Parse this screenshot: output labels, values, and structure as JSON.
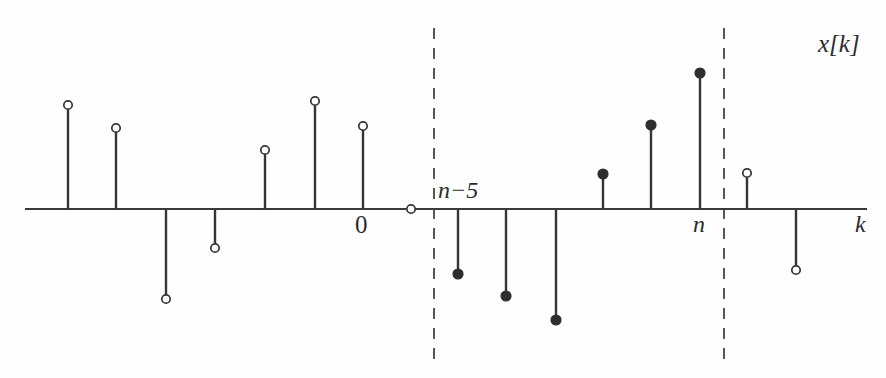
{
  "figure": {
    "title": "x[k]",
    "axis_label_x": "k",
    "origin_label": "0",
    "window_start_label": "n−5",
    "window_end_label": "n",
    "colors": {
      "axis": "#3a3a3a",
      "stem": "#353535",
      "marker_filled": "#2e2e2e",
      "marker_open_fill": "#ffffff",
      "window_dash": "#565656",
      "background": "#fefefe"
    }
  },
  "chart_data": {
    "type": "scatter",
    "title": "x[k]",
    "xlabel": "k",
    "ylabel": "",
    "grid": false,
    "legend": null,
    "axis_y_px": 209,
    "axis_x_range_px": [
      25,
      867
    ],
    "window_boundaries_px": [
      434,
      724
    ],
    "window_dash_y_range_px": [
      28,
      360
    ],
    "marker_radius_px": 4.2,
    "marker_radius_filled_px": 5.0,
    "x": [
      68,
      116,
      166,
      215,
      265,
      315,
      363,
      411,
      458,
      506,
      556,
      603,
      651,
      700,
      747,
      796
    ],
    "values": [
      104,
      81,
      -90,
      -39,
      59,
      108,
      83,
      0,
      -65,
      -87,
      -111,
      35,
      84,
      136,
      36,
      -61
    ],
    "marker_styles": [
      "open",
      "open",
      "open",
      "open",
      "open",
      "open",
      "open",
      "open",
      "filled",
      "filled",
      "filled",
      "filled",
      "filled",
      "filled",
      "open",
      "open"
    ],
    "points": [
      {
        "x_px": 68,
        "value": 104,
        "marker": "open"
      },
      {
        "x_px": 116,
        "value": 81,
        "marker": "open"
      },
      {
        "x_px": 166,
        "value": -90,
        "marker": "open"
      },
      {
        "x_px": 215,
        "value": -39,
        "marker": "open"
      },
      {
        "x_px": 265,
        "value": 59,
        "marker": "open"
      },
      {
        "x_px": 315,
        "value": 108,
        "marker": "open"
      },
      {
        "x_px": 363,
        "value": 83,
        "marker": "open"
      },
      {
        "x_px": 411,
        "value": 0,
        "marker": "open"
      },
      {
        "x_px": 458,
        "value": -65,
        "marker": "filled"
      },
      {
        "x_px": 506,
        "value": -87,
        "marker": "filled"
      },
      {
        "x_px": 556,
        "value": -111,
        "marker": "filled"
      },
      {
        "x_px": 603,
        "value": 35,
        "marker": "filled"
      },
      {
        "x_px": 651,
        "value": 84,
        "marker": "filled"
      },
      {
        "x_px": 700,
        "value": 136,
        "marker": "filled"
      },
      {
        "x_px": 747,
        "value": 36,
        "marker": "open"
      },
      {
        "x_px": 796,
        "value": -61,
        "marker": "open"
      }
    ],
    "annotations": [
      {
        "text": "x[k]",
        "x_px": 818,
        "y_px": 31,
        "name": "signal-label"
      },
      {
        "text": "0",
        "x_px": 355,
        "y_px": 212,
        "name": "origin-label"
      },
      {
        "text": "n−5",
        "x_px": 438,
        "y_px": 178,
        "name": "window-start-label"
      },
      {
        "text": "n",
        "x_px": 693,
        "y_px": 212,
        "name": "window-end-label"
      },
      {
        "text": "k",
        "x_px": 855,
        "y_px": 212,
        "name": "x-axis-label"
      }
    ]
  }
}
